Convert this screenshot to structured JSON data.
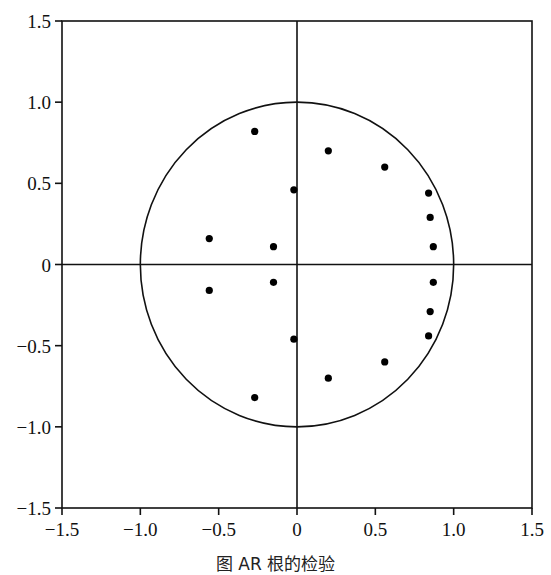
{
  "chart_data": {
    "type": "scatter",
    "title": "",
    "caption": "图 AR 根的检验",
    "xlabel": "",
    "ylabel": "",
    "xlim": [
      -1.5,
      1.5
    ],
    "ylim": [
      -1.5,
      1.5
    ],
    "x_ticks": [
      "-1.5",
      "-1.0",
      "-0.5",
      "0",
      "0.5",
      "1.0",
      "1.5"
    ],
    "y_ticks": [
      "1.5",
      "1.0",
      "0.5",
      "0",
      "-0.5",
      "-1.0",
      "-1.5"
    ],
    "grid": false,
    "legend": null,
    "unit_circle": {
      "center": [
        0,
        0
      ],
      "radius": 1.0
    },
    "reference_lines": {
      "x": 0,
      "y": 0
    },
    "series": [
      {
        "name": "inverse roots",
        "points": [
          [
            -0.27,
            0.82
          ],
          [
            0.2,
            0.7
          ],
          [
            0.56,
            0.6
          ],
          [
            -0.02,
            0.46
          ],
          [
            0.84,
            0.44
          ],
          [
            0.85,
            0.29
          ],
          [
            -0.56,
            0.16
          ],
          [
            -0.15,
            0.11
          ],
          [
            0.87,
            0.11
          ],
          [
            -0.27,
            -0.82
          ],
          [
            0.2,
            -0.7
          ],
          [
            0.56,
            -0.6
          ],
          [
            -0.02,
            -0.46
          ],
          [
            0.84,
            -0.44
          ],
          [
            0.85,
            -0.29
          ],
          [
            -0.56,
            -0.16
          ],
          [
            -0.15,
            -0.11
          ],
          [
            0.87,
            -0.11
          ]
        ]
      }
    ]
  }
}
